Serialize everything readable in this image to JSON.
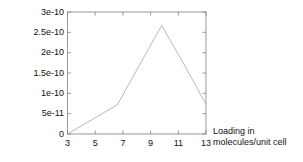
{
  "chart_data": {
    "type": "line",
    "title": "",
    "subtitle": "",
    "xlabel_line1": "Loading in",
    "xlabel_line2": "molecules/unit cell",
    "ylabel": "D / (m^2/s)",
    "xlim": [
      3,
      13
    ],
    "ylim": [
      0,
      3e-10
    ],
    "grid": false,
    "legend": null,
    "x_ticks": [
      3,
      5,
      7,
      9,
      11,
      13
    ],
    "x_tick_labels": [
      "3",
      "5",
      "7",
      "9",
      "11",
      "13"
    ],
    "y_ticks": [
      0,
      5e-11,
      1e-10,
      1.5e-10,
      2e-10,
      2.5e-10,
      3e-10
    ],
    "y_tick_labels": [
      "0",
      "5e-11",
      "1e-10",
      "1.5e-10",
      "2e-10",
      "2.5e-10",
      "3e-10"
    ],
    "series": [
      {
        "name": "D",
        "x": [
          3.0,
          6.6,
          9.8,
          11.4,
          13.0
        ],
        "values": [
          0.0,
          7.2e-11,
          2.67e-10,
          1.72e-10,
          7.3e-11
        ]
      }
    ],
    "line_color": "#b0b0b0",
    "frame_color": "#808080",
    "background_color": "#ffffff"
  }
}
